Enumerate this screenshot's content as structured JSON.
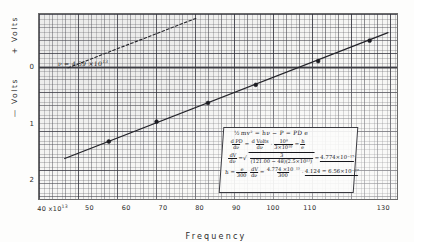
{
  "chart_data": {
    "type": "scatter",
    "title": "",
    "subtitle": "",
    "xlabel": "Frequency",
    "ylabel_positive": "+ Volts",
    "ylabel_negative": "— Volts",
    "x_tick_labels": [
      "40 x10",
      "50",
      "60",
      "70",
      "80",
      "90",
      "100",
      "110",
      "130"
    ],
    "x_tick_exponent": "13",
    "x_tick_values": [
      40,
      50,
      60,
      70,
      80,
      90,
      100,
      110,
      130
    ],
    "y_tick_labels": [
      "0",
      "1",
      "2"
    ],
    "y_tick_values": [
      0,
      -1,
      -2
    ],
    "xlim": [
      36,
      134
    ],
    "ylim": [
      -2.35,
      0.95
    ],
    "grid": true,
    "grid_style": "graph-paper",
    "legend": "none",
    "series": [
      {
        "name": "stopping potential data",
        "style": "solid-line-with-points",
        "points": [
          {
            "x": 55.0,
            "y": -1.3
          },
          {
            "x": 68.0,
            "y": -0.95
          },
          {
            "x": 82.0,
            "y": -0.62
          },
          {
            "x": 95.0,
            "y": -0.3
          },
          {
            "x": 112.0,
            "y": 0.12
          },
          {
            "x": 126.0,
            "y": 0.48
          }
        ],
        "fit_line": {
          "x1": 43.0,
          "y1": -1.6,
          "x2": 131.0,
          "y2": 0.62
        }
      },
      {
        "name": "extrapolated upper line",
        "style": "dashed",
        "points": [],
        "fit_line": {
          "x1": 43.9,
          "y1": 0.0,
          "x2": 79.0,
          "y2": 0.88
        }
      }
    ],
    "annotations": [
      {
        "name": "threshold-frequency",
        "text": "ν = 4.39 ×10",
        "exponent": "13",
        "x": 44,
        "y": 0.0
      },
      {
        "name": "zero-line",
        "text": "0",
        "type": "horizontal-rule",
        "y": 0
      }
    ]
  },
  "axis": {
    "x_label": "Frequency",
    "y_label_positive": "+ Volts",
    "y_label_negative": "— Volts",
    "x_ticks": [
      {
        "label": "40 x10",
        "sup": "13",
        "value": 40
      },
      {
        "label": "50",
        "sup": "",
        "value": 50
      },
      {
        "label": "60",
        "sup": "",
        "value": 60
      },
      {
        "label": "70",
        "sup": "",
        "value": 70
      },
      {
        "label": "80",
        "sup": "",
        "value": 80
      },
      {
        "label": "90",
        "sup": "",
        "value": 90
      },
      {
        "label": "100",
        "sup": "",
        "value": 100
      },
      {
        "label": "110",
        "sup": "",
        "value": 110
      },
      {
        "label": "130",
        "sup": "",
        "value": 130
      }
    ],
    "y_ticks": [
      {
        "label": "0",
        "value": 0
      },
      {
        "label": "1",
        "value": -1
      },
      {
        "label": "2",
        "value": -2
      }
    ]
  },
  "annotation": {
    "threshold": {
      "symbol": "ν",
      "equals": "=",
      "value": "4.39",
      "times": "×10",
      "exponent": "13",
      "full_text": "ν = 4.39 ×10¹³"
    }
  },
  "equation_box": {
    "line1": {
      "half": "½",
      "body": "mv² = hν − P = PD e"
    },
    "line2": {
      "frac1_num": "d PD",
      "frac1_den": "dν",
      "eq1": "=",
      "frac2_num": "d Volts",
      "frac2_den": "dν",
      "dot": "·",
      "frac3_num": "10⁸",
      "frac3_den": "3×10¹⁰",
      "eq2": "=",
      "frac4_num": "h",
      "frac4_den": "e"
    },
    "line3": {
      "frac1_num": "dV",
      "frac1_den": "dν",
      "eq1": "=",
      "radical": "√",
      "denom_expr": "(121.00 − 48)(2.5×10¹³)",
      "numer_expr": "3",
      "eq2": "=",
      "result": "4.774×10⁻¹⁵"
    },
    "line4": {
      "lead": "h =",
      "frac1_num": "e",
      "frac1_den": "300",
      "frac2_num": "dV",
      "frac2_den": "dν",
      "eq1": "=",
      "frac3_num": "4.774 ×10⁻¹⁵",
      "frac3_den": "300",
      "eq2": "·",
      "tail": "4.124 = 6.56×10⁻²⁷"
    }
  }
}
